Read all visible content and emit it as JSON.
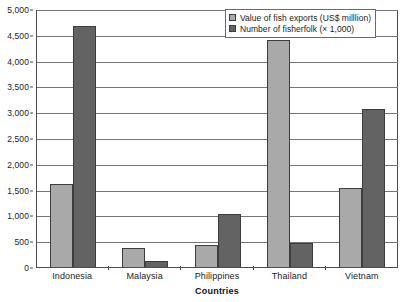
{
  "chart_data": {
    "type": "bar",
    "title": "",
    "subtitle": "",
    "xlabel": "Countries",
    "ylabel": "",
    "ylim": [
      0,
      5000
    ],
    "ytick_step": 500,
    "ytick_labels": [
      "0",
      "500",
      "1,000",
      "1,500",
      "2,000",
      "2,500",
      "3,000",
      "3,500",
      "4,000",
      "4,500",
      "5,000"
    ],
    "ytick_values": [
      0,
      500,
      1000,
      1500,
      2000,
      2500,
      3000,
      3500,
      4000,
      4500,
      5000
    ],
    "grid": true,
    "grid_axis": "y",
    "legend_position": "top-right",
    "categories": [
      "Indonesia",
      "Malaysia",
      "Philippines",
      "Thailand",
      "Vietnam"
    ],
    "series": [
      {
        "name": "Value of fish exports (US$ milllion)",
        "color": "#a9a9a9",
        "values": [
          1600,
          370,
          420,
          4400,
          1530
        ]
      },
      {
        "name": "Number of fisherfolk (× 1,000)",
        "color": "#636363",
        "values": [
          4680,
          110,
          1020,
          470,
          3060
        ]
      }
    ],
    "annotations": []
  },
  "legend": {
    "entries": [
      {
        "label": "Value of fish exports (US$ milllion)"
      },
      {
        "label": "Number of fisherfolk (× 1,000)"
      }
    ]
  }
}
